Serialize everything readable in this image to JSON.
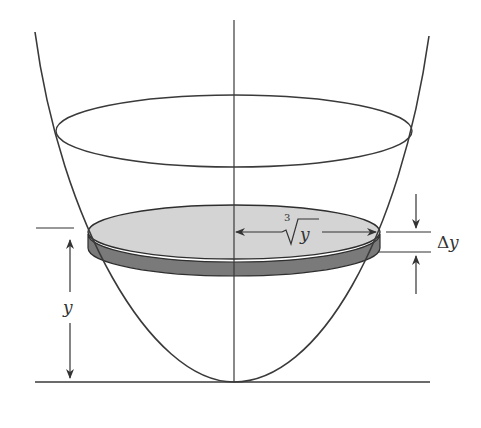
{
  "diagram": {
    "labels": {
      "radius": "y",
      "radius_root_index": "3",
      "thickness_delta": "Δ",
      "thickness_var": "y",
      "height": "y"
    },
    "colors": {
      "stroke": "#3a3a3a",
      "disk_top": "#d4d4d4",
      "disk_side": "#7a7a7a",
      "background": "#ffffff"
    },
    "geometry": {
      "axis_x": 234,
      "vertex_y": 382,
      "top_ellipse": {
        "cy": 131,
        "rx": 178,
        "ry": 36
      },
      "disk": {
        "cy": 232,
        "rx": 146,
        "ry": 28,
        "thickness": 14
      }
    }
  }
}
